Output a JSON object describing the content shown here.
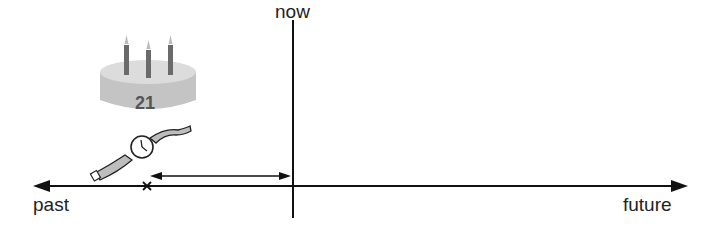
{
  "diagram": {
    "labels": {
      "now": "now",
      "past": "past",
      "future": "future"
    },
    "cake": {
      "number": "21",
      "candles": 3
    },
    "icons": [
      "birthday-cake-icon",
      "wristwatch-icon"
    ],
    "marker": "x",
    "colors": {
      "line": "#111111",
      "cake": "#bdbdbd",
      "candle": "#666666",
      "cake_text": "#555555"
    }
  }
}
